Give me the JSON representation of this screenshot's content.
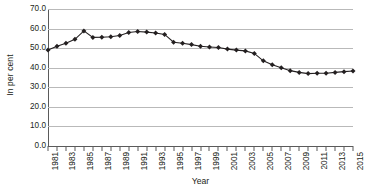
{
  "chart_data": {
    "type": "line",
    "title": "",
    "subtitle": "",
    "xlabel": "Year",
    "ylabel": "In per cent",
    "ylim": [
      0.0,
      70.0
    ],
    "ytick_step": 10.0,
    "ytick_labels": [
      "70.0",
      "60.0",
      "50.0",
      "40.0",
      "30.0",
      "20.0",
      "10.0",
      "0.0"
    ],
    "ytick_values": [
      70.0,
      60.0,
      50.0,
      40.0,
      30.0,
      20.0,
      10.0,
      0.0
    ],
    "xlim": [
      1981,
      2015
    ],
    "xtick_label_interval": 2,
    "xtick_labels": [
      "1981",
      "1983",
      "1985",
      "1987",
      "1989",
      "1991",
      "1993",
      "1995",
      "1997",
      "1999",
      "2001",
      "2003",
      "2005",
      "2007",
      "2009",
      "2011",
      "2013",
      "2015"
    ],
    "grid": "horizontal",
    "legend": "none",
    "marker": "diamond",
    "series_color": "#231f20",
    "grid_color": "#b9b9b9",
    "axis_color": "#5a5a5a",
    "x": [
      1981,
      1982,
      1983,
      1984,
      1985,
      1986,
      1987,
      1988,
      1989,
      1990,
      1991,
      1992,
      1993,
      1994,
      1995,
      1996,
      1997,
      1998,
      1999,
      2000,
      2001,
      2002,
      2003,
      2004,
      2005,
      2006,
      2007,
      2008,
      2009,
      2010,
      2011,
      2012,
      2013,
      2014,
      2015
    ],
    "values": [
      49.0,
      51.0,
      52.5,
      54.5,
      58.8,
      55.5,
      55.6,
      55.8,
      56.5,
      58.0,
      58.5,
      58.2,
      57.7,
      57.0,
      53.0,
      52.5,
      51.8,
      51.0,
      50.6,
      50.3,
      49.5,
      49.0,
      48.6,
      47.3,
      43.5,
      41.5,
      40.0,
      38.5,
      37.6,
      37.0,
      37.2,
      37.2,
      37.6,
      38.0,
      38.3
    ],
    "series": [
      {
        "name": "In per cent",
        "values": [
          49.0,
          51.0,
          52.5,
          54.5,
          58.8,
          55.5,
          55.6,
          55.8,
          56.5,
          58.0,
          58.5,
          58.2,
          57.7,
          57.0,
          53.0,
          52.5,
          51.8,
          51.0,
          50.6,
          50.3,
          49.5,
          49.0,
          48.6,
          47.3,
          43.5,
          41.5,
          40.0,
          38.5,
          37.6,
          37.0,
          37.2,
          37.2,
          37.6,
          38.0,
          38.3
        ]
      }
    ]
  }
}
